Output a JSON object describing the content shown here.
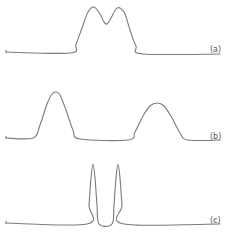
{
  "chart_data": [
    {
      "type": "line",
      "panel": "a",
      "label": "(a)",
      "title": "",
      "xlabel": "",
      "ylabel": "",
      "grid": false,
      "description": "Two partially overlapping (poorly resolved) peaks",
      "series": [
        {
          "name": "trace-a",
          "points": [
            [
              6,
              52
            ],
            [
              70,
              53
            ],
            [
              76,
              44
            ],
            [
              82,
              28
            ],
            [
              88,
              12
            ],
            [
              94,
              7
            ],
            [
              100,
              14
            ],
            [
              104,
              22
            ],
            [
              107,
              24
            ],
            [
              111,
              18
            ],
            [
              116,
              9
            ],
            [
              120,
              8
            ],
            [
              125,
              14
            ],
            [
              130,
              30
            ],
            [
              136,
              46
            ],
            [
              143,
              54
            ],
            [
              220,
              54
            ]
          ]
        }
      ],
      "peaks": [
        {
          "x": 94,
          "height": 45
        },
        {
          "x": 120,
          "height": 45
        }
      ],
      "baseline_y": 53
    },
    {
      "type": "line",
      "panel": "b",
      "label": "(b)",
      "title": "",
      "xlabel": "",
      "ylabel": "",
      "grid": false,
      "description": "Two well-separated broad peaks",
      "series": [
        {
          "name": "trace-b",
          "points": [
            [
              6,
              138
            ],
            [
              33,
              138
            ],
            [
              40,
              125
            ],
            [
              47,
              104
            ],
            [
              52,
              94
            ],
            [
              56,
              92
            ],
            [
              60,
              95
            ],
            [
              66,
              110
            ],
            [
              73,
              130
            ],
            [
              80,
              139
            ],
            [
              128,
              140
            ],
            [
              135,
              132
            ],
            [
              143,
              116
            ],
            [
              150,
              106
            ],
            [
              157,
              103
            ],
            [
              164,
              106
            ],
            [
              172,
              118
            ],
            [
              180,
              133
            ],
            [
              188,
              140
            ],
            [
              220,
              140
            ]
          ]
        }
      ],
      "peaks": [
        {
          "x": 56,
          "height": 46
        },
        {
          "x": 157,
          "height": 37
        }
      ],
      "baseline_y": 139
    },
    {
      "type": "line",
      "panel": "c",
      "label": "(c)",
      "title": "",
      "xlabel": "",
      "ylabel": "",
      "grid": false,
      "description": "Two narrow, fully resolved peaks",
      "series": [
        {
          "name": "trace-c",
          "points": [
            [
              6,
              223
            ],
            [
              87,
              224
            ],
            [
              89,
              205
            ],
            [
              91,
              178
            ],
            [
              93,
              164
            ],
            [
              95,
              178
            ],
            [
              97,
              205
            ],
            [
              99,
              224
            ],
            [
              112,
              224
            ],
            [
              114,
              205
            ],
            [
              116,
              178
            ],
            [
              118,
              164
            ],
            [
              120,
              178
            ],
            [
              122,
              205
            ],
            [
              124,
              224
            ],
            [
              220,
              224
            ]
          ]
        }
      ],
      "peaks": [
        {
          "x": 93,
          "height": 60
        },
        {
          "x": 118,
          "height": 60
        }
      ],
      "baseline_y": 224
    }
  ],
  "labels": {
    "a": "(a)",
    "b": "(b)",
    "c": "(c)"
  },
  "colors": {
    "trace": "#7a7a7a",
    "label": "#555555",
    "background": "#ffffff"
  }
}
